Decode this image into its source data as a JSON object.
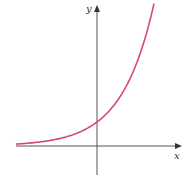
{
  "chart_data": {
    "type": "line",
    "title": "",
    "xlabel": "x",
    "ylabel": "y",
    "function": "y = e^x (exponential growth)",
    "grid": false,
    "legend": null,
    "xlim": [
      -2.53,
      2.6
    ],
    "ylim": [
      -1.2,
      5.9
    ],
    "series": [
      {
        "name": "exponential curve",
        "color": "#d64a6a",
        "x": [
          -2.5,
          -2.0,
          -1.5,
          -1.0,
          -0.5,
          0.0,
          0.5,
          1.0,
          1.5,
          1.78
        ],
        "y": [
          0.08,
          0.14,
          0.22,
          0.37,
          0.61,
          1.0,
          1.65,
          2.72,
          4.48,
          5.9
        ]
      }
    ],
    "annotations": {
      "y_intercept": 1
    }
  },
  "axes": {
    "x_label": "x",
    "y_label": "y",
    "axis_color": "#555555"
  }
}
